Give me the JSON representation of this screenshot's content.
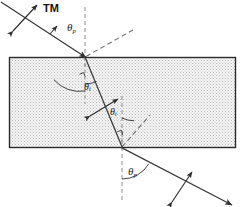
{
  "figure": {
    "kind": "optics-ray-diagram",
    "title_label": "TM",
    "labels": {
      "tm": "TM",
      "theta_p_top": "θ",
      "theta_p_top_sub": "p",
      "theta_t_upper": "θ",
      "theta_t_upper_sub": "t",
      "theta_t_lower": "θ",
      "theta_t_lower_sub": "t",
      "theta_p_bottom": "θ",
      "theta_p_bottom_sub": "p"
    },
    "colors": {
      "ray": "#3a3a3a",
      "slab_border": "#2b2b2b",
      "slab_fill": "#f2f2f2",
      "slab_stipple": "#b9b9b9",
      "dashed": "#8a8a8a",
      "text": "#161616",
      "background": "#ffffff"
    },
    "geometry": {
      "slab": {
        "x": 9,
        "y": 57,
        "width": 227,
        "height": 91
      },
      "entry_point": {
        "x": 85,
        "y": 57
      },
      "exit_point": {
        "x": 122,
        "y": 148
      },
      "incident_ray": {
        "from": {
          "x": 2,
          "y": 3
        },
        "to": {
          "x": 85,
          "y": 57
        }
      },
      "internal_ray": {
        "from": {
          "x": 85,
          "y": 57
        },
        "to": {
          "x": 122,
          "y": 148
        }
      },
      "exit_ray": {
        "from": {
          "x": 122,
          "y": 148
        },
        "to": {
          "x": 229,
          "y": 203
        }
      },
      "normal_top": {
        "x": 85,
        "y1": 7,
        "y2": 70
      },
      "normal_bottom": {
        "x": 122,
        "y1": 132,
        "y2": 200
      },
      "reflected_dashed_top": {
        "from": {
          "x": 85,
          "y": 57
        },
        "to": {
          "x": 128,
          "y": 33
        }
      },
      "reflected_dashed_bottom": {
        "from": {
          "x": 122,
          "y": 148
        },
        "to": {
          "x": 148,
          "y": 118
        }
      },
      "arcs": [
        {
          "name": "theta-p-top-arc",
          "center": {
            "x": 85,
            "y": 57
          },
          "radius": 33
        },
        {
          "name": "theta-t-upper-arc",
          "center": {
            "x": 85,
            "y": 57
          },
          "radius": 27
        },
        {
          "name": "theta-t-lower-arc",
          "center": {
            "x": 122,
            "y": 148
          },
          "radius": 30
        },
        {
          "name": "theta-p-bottom-arc",
          "center": {
            "x": 122,
            "y": 148
          },
          "radius": 31
        }
      ],
      "polarization_markers": [
        {
          "name": "incident-polarization-arrow",
          "center": {
            "x": 25,
            "y": 18
          }
        },
        {
          "name": "internal-polarization-arrow",
          "center": {
            "x": 104,
            "y": 108
          }
        },
        {
          "name": "exit-polarization-arrow",
          "center": {
            "x": 181,
            "y": 186
          }
        }
      ]
    }
  }
}
